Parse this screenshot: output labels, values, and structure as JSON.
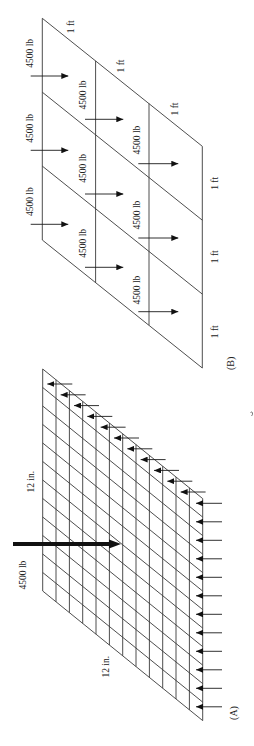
{
  "figure": {
    "panel_a": {
      "label": "(A)",
      "load_label": "4500 lb",
      "dimension_labels": [
        "12 in.",
        "12 in."
      ],
      "grid_divisions": 12,
      "edge_arrow_count": 23
    },
    "panel_b": {
      "label": "(B)",
      "load_labels": [
        "4500 lb",
        "4500 lb",
        "4500 lb",
        "4500 lb",
        "4500 lb",
        "4500 lb",
        "4500 lb",
        "4500 lb",
        "4500 lb"
      ],
      "dimension_labels": [
        "1 ft",
        "1 ft",
        "1 ft",
        "1 ft",
        "1 ft",
        "1 ft"
      ],
      "grid_divisions": 3
    },
    "colors": {
      "line": "#3a3a3a",
      "arrow": "#1a1a1a",
      "background": "#ffffff"
    }
  }
}
